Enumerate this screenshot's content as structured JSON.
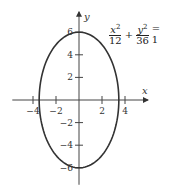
{
  "chart_data": {
    "type": "line",
    "title": "",
    "equation": {
      "term1_num": "x",
      "term1_exp": "2",
      "term1_den": "12",
      "plus": "+",
      "term2_num": "y",
      "term2_exp": "2",
      "term2_den": "36",
      "rhs": "= 1"
    },
    "xlabel": "x",
    "ylabel": "y",
    "xlim": [
      -5.8,
      6.0
    ],
    "ylim": [
      -7.5,
      7.8
    ],
    "x_ticks": [
      -4,
      -2,
      2,
      4
    ],
    "x_tick_labels": [
      "−4",
      "−2",
      "2",
      "4"
    ],
    "y_ticks": [
      -6,
      -4,
      -2,
      2,
      4,
      6
    ],
    "y_tick_labels": [
      "−6",
      "−4",
      "−2",
      "2",
      "4",
      "6"
    ],
    "series": [
      {
        "name": "ellipse",
        "a_squared": 12,
        "b_squared": 36,
        "color": "#333333"
      }
    ],
    "grid": false
  }
}
